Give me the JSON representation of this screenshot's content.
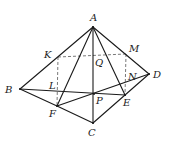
{
  "diagram": {
    "type": "geometry-solid",
    "points": {
      "A": {
        "x": 93,
        "y": 27,
        "label": "A",
        "lx": 90,
        "ly": 21
      },
      "B": {
        "x": 20,
        "y": 89,
        "label": "B",
        "lx": 5,
        "ly": 93
      },
      "C": {
        "x": 93,
        "y": 123,
        "label": "C",
        "lx": 88,
        "ly": 136
      },
      "D": {
        "x": 149,
        "y": 74,
        "label": "D",
        "lx": 153,
        "ly": 78
      },
      "E": {
        "x": 125,
        "y": 95,
        "label": "E",
        "lx": 123,
        "ly": 106
      },
      "F": {
        "x": 57,
        "y": 106,
        "label": "F",
        "lx": 49,
        "ly": 117
      },
      "P": {
        "x": 94,
        "y": 94,
        "label": "P",
        "lx": 96,
        "ly": 104
      },
      "K": {
        "x": 58,
        "y": 57,
        "label": "K",
        "lx": 44,
        "ly": 58
      },
      "M": {
        "x": 126,
        "y": 54,
        "label": "M",
        "lx": 129,
        "ly": 52
      },
      "Q": {
        "x": 93,
        "y": 55,
        "label": "Q",
        "lx": 95,
        "ly": 66
      },
      "L": {
        "x": 58,
        "y": 90,
        "label": "L",
        "lx": 49,
        "ly": 89
      },
      "N": {
        "x": 126,
        "y": 79,
        "label": "N",
        "lx": 128,
        "ly": 80
      }
    },
    "solid_segments": [
      [
        "A",
        "B"
      ],
      [
        "A",
        "D"
      ],
      [
        "A",
        "C"
      ],
      [
        "A",
        "F"
      ],
      [
        "A",
        "E"
      ],
      [
        "B",
        "F"
      ],
      [
        "F",
        "C"
      ],
      [
        "C",
        "E"
      ],
      [
        "E",
        "D"
      ],
      [
        "B",
        "E"
      ],
      [
        "F",
        "D"
      ]
    ],
    "dashed_segments": [
      [
        "K",
        "M"
      ],
      [
        "K",
        "F"
      ],
      [
        "M",
        "E"
      ]
    ],
    "labels": [
      "A",
      "B",
      "C",
      "D",
      "E",
      "F",
      "K",
      "L",
      "M",
      "N",
      "P",
      "Q"
    ]
  }
}
